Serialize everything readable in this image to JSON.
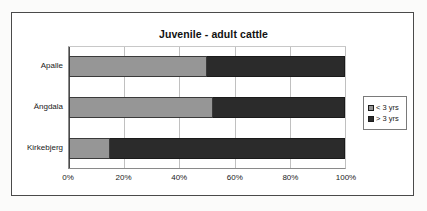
{
  "chart_data": {
    "type": "bar",
    "orientation": "horizontal",
    "stacked": true,
    "normalized": true,
    "title": "Juvenile - adult cattle",
    "xlabel": "",
    "ylabel": "",
    "xlim": [
      0,
      100
    ],
    "xticks": [
      "0%",
      "20%",
      "40%",
      "60%",
      "80%",
      "100%"
    ],
    "xtick_values": [
      0,
      20,
      40,
      60,
      80,
      100
    ],
    "grid": true,
    "legend_position": "right",
    "categories": [
      "Apalle",
      "Ängdala",
      "Kirkebjerg"
    ],
    "series": [
      {
        "name": "< 3 yrs",
        "color": "#969696",
        "values": [
          50,
          52,
          15
        ]
      },
      {
        "name": "> 3 yrs",
        "color": "#2b2b2b",
        "values": [
          50,
          48,
          85
        ]
      }
    ]
  },
  "colors": {
    "series_low": "#969696",
    "series_high": "#2b2b2b",
    "frame_border": "#4a4a4a",
    "gridline": "#c0c0c0",
    "page_background": "#fbfbfa",
    "plot_background": "#ffffff",
    "text": "#1a1a1a"
  }
}
